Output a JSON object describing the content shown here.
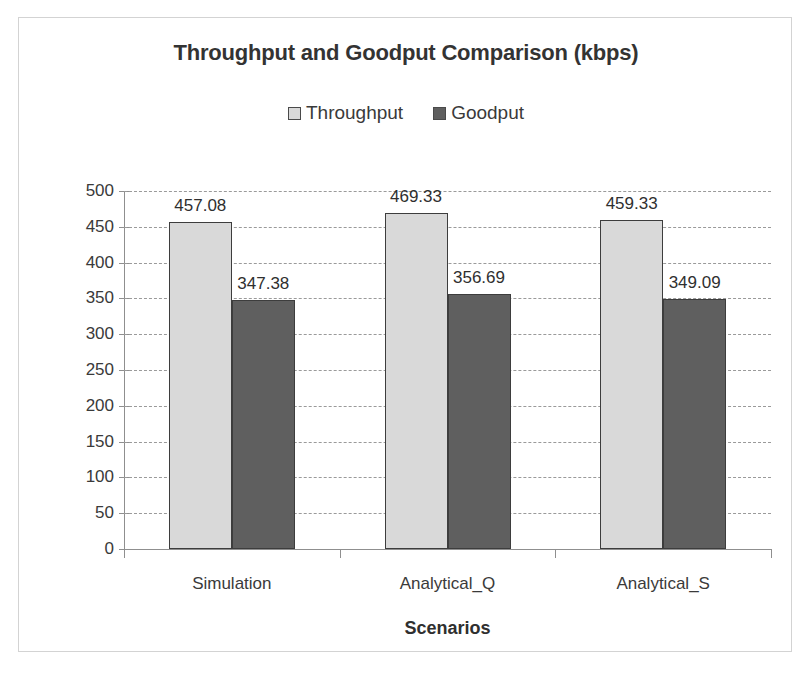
{
  "chart_data": {
    "type": "bar",
    "title": "Throughput and Goodput Comparison (kbps)",
    "xlabel": "Scenarios",
    "ylabel": "Mean transmission rate (kbps)",
    "categories": [
      "Simulation",
      "Analytical_Q",
      "Analytical_S"
    ],
    "series": [
      {
        "name": "Throughput",
        "color": "#d9d9d9",
        "values": [
          457.08,
          469.33,
          459.33
        ],
        "labels": [
          "457.08",
          "469.33",
          "459.33"
        ]
      },
      {
        "name": "Goodput",
        "color": "#5f5f5f",
        "values": [
          347.38,
          356.69,
          349.09
        ],
        "labels": [
          "347.38",
          "356.69",
          "349.09"
        ]
      }
    ],
    "ylim": [
      0,
      500
    ],
    "ytick_step": 50,
    "yticks": [
      0,
      50,
      100,
      150,
      200,
      250,
      300,
      350,
      400,
      450,
      500
    ],
    "ytick_labels": [
      "0",
      "50",
      "100",
      "150",
      "200",
      "250",
      "300",
      "350",
      "400",
      "450",
      "500"
    ],
    "grid": true,
    "grid_style": "dashed",
    "grid_color": "#9a9a9a",
    "legend_position": "top-center",
    "bar_outline_color": "#3d3d3d",
    "text_color": "#333333"
  },
  "legend": {
    "entries": [
      {
        "label": "Throughput",
        "swatch": "legend-swatch-throughput",
        "color": "#d9d9d9"
      },
      {
        "label": "Goodput",
        "swatch": "legend-swatch-goodput",
        "color": "#5f5f5f"
      }
    ]
  }
}
